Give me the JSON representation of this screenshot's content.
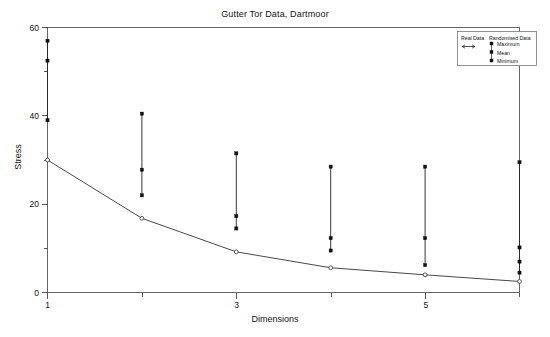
{
  "chart_data": {
    "type": "line",
    "title": "Gutter Tor Data, Dartmoor",
    "xlabel": "Dimensions",
    "ylabel": "Stress",
    "xlim": [
      1,
      6
    ],
    "ylim": [
      0,
      60
    ],
    "x": [
      1,
      2,
      3,
      4,
      5,
      6
    ],
    "xticks_major": [
      1,
      3,
      5
    ],
    "xticks_major_labels": [
      "1",
      "3",
      "5"
    ],
    "xticks_minor": [
      2,
      4,
      6
    ],
    "yticks_major": [
      0,
      20,
      40,
      60
    ],
    "yticks_major_labels": [
      "0",
      "20",
      "40",
      "60"
    ],
    "yticks_minor": [
      10,
      30,
      50
    ],
    "grid": false,
    "legend_position": "top-right",
    "series": [
      {
        "name": "Real Data",
        "marker": "open-circle",
        "style": "line-with-markers",
        "values": [
          30.0,
          16.8,
          9.2,
          5.6,
          4.0,
          2.5
        ]
      },
      {
        "name": "Maximum",
        "group": "Randomised Data",
        "marker": "filled-square",
        "values": [
          57.0,
          40.5,
          31.5,
          28.5,
          28.5,
          29.5
        ]
      },
      {
        "name": "Mean",
        "group": "Randomised Data",
        "marker": "filled-square",
        "values": [
          52.5,
          27.8,
          17.3,
          12.3,
          12.3,
          10.2
        ]
      },
      {
        "name": "Minimum",
        "group": "Randomised Data",
        "marker": "filled-square",
        "values": [
          39.0,
          22.0,
          14.5,
          9.5,
          6.2,
          4.5
        ]
      }
    ],
    "extra_points": [
      {
        "x": 6,
        "y": 7.0,
        "marker": "filled-square",
        "series": "Randomised Data"
      }
    ]
  },
  "legend": {
    "col1_header": "Real Data",
    "col2_header": "Randomised Data",
    "entries": [
      {
        "label": "Maximum"
      },
      {
        "label": "Mean"
      },
      {
        "label": "Minimum"
      }
    ]
  }
}
